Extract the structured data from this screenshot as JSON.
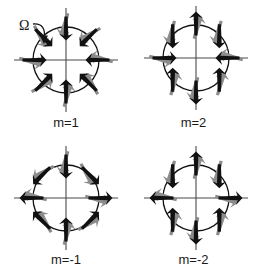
{
  "figure": {
    "background_color": "#ffffff",
    "arrow_dark_color": "#111111",
    "arrow_gray_color": "#8c8c8c",
    "axis_color": "#4a4a4a",
    "ring_color": "#111111",
    "label_color": "#1a1a1a"
  },
  "annotation": {
    "omega_symbol": "Ω",
    "omega_name": "omega-rotation-symbol",
    "arc_direction": "counterclockwise",
    "arc_icon": "curved-arrow-icon"
  },
  "chart_data": {
    "type": "diagram",
    "xlabel": "",
    "ylabel": "",
    "grid": false,
    "legend": "none",
    "n_arrows_per_panel": 8,
    "arrow_positions_deg": [
      90,
      45,
      0,
      315,
      270,
      225,
      180,
      135
    ],
    "panels": [
      {
        "id": "m1",
        "label": "m=1",
        "m": 1,
        "row": 0,
        "col": 0,
        "center": [
          66,
          60
        ],
        "radius": 33,
        "axis_half_length": 52,
        "has_omega": true,
        "arrows": [
          {
            "pos_deg": 90,
            "dir_deg": 270
          },
          {
            "pos_deg": 45,
            "dir_deg": 225
          },
          {
            "pos_deg": 0,
            "dir_deg": 180
          },
          {
            "pos_deg": 315,
            "dir_deg": 135
          },
          {
            "pos_deg": 270,
            "dir_deg": 90
          },
          {
            "pos_deg": 225,
            "dir_deg": 45
          },
          {
            "pos_deg": 180,
            "dir_deg": 0
          },
          {
            "pos_deg": 135,
            "dir_deg": 315
          }
        ]
      },
      {
        "id": "m2",
        "label": "m=2",
        "m": 2,
        "row": 0,
        "col": 1,
        "center": [
          196,
          58
        ],
        "radius": 33,
        "axis_half_length": 52,
        "has_omega": false,
        "arrows": [
          {
            "pos_deg": 90,
            "dir_deg": 90
          },
          {
            "pos_deg": 45,
            "dir_deg": 270
          },
          {
            "pos_deg": 0,
            "dir_deg": 180
          },
          {
            "pos_deg": 315,
            "dir_deg": 90
          },
          {
            "pos_deg": 270,
            "dir_deg": 270
          },
          {
            "pos_deg": 225,
            "dir_deg": 90
          },
          {
            "pos_deg": 180,
            "dir_deg": 0
          },
          {
            "pos_deg": 135,
            "dir_deg": 270
          }
        ]
      },
      {
        "id": "mm1",
        "label": "m=-1",
        "m": -1,
        "row": 1,
        "col": 0,
        "center": [
          66,
          198
        ],
        "radius": 33,
        "axis_half_length": 52,
        "has_omega": false,
        "arrows": [
          {
            "pos_deg": 90,
            "dir_deg": 270
          },
          {
            "pos_deg": 45,
            "dir_deg": 315
          },
          {
            "pos_deg": 0,
            "dir_deg": 0
          },
          {
            "pos_deg": 315,
            "dir_deg": 45
          },
          {
            "pos_deg": 270,
            "dir_deg": 90
          },
          {
            "pos_deg": 225,
            "dir_deg": 135
          },
          {
            "pos_deg": 180,
            "dir_deg": 180
          },
          {
            "pos_deg": 135,
            "dir_deg": 225
          }
        ]
      },
      {
        "id": "mm2",
        "label": "m=-2",
        "m": -2,
        "row": 1,
        "col": 1,
        "center": [
          196,
          198
        ],
        "radius": 33,
        "axis_half_length": 52,
        "has_omega": false,
        "arrows": [
          {
            "pos_deg": 90,
            "dir_deg": 90
          },
          {
            "pos_deg": 45,
            "dir_deg": 270
          },
          {
            "pos_deg": 0,
            "dir_deg": 0
          },
          {
            "pos_deg": 315,
            "dir_deg": 90
          },
          {
            "pos_deg": 270,
            "dir_deg": 270
          },
          {
            "pos_deg": 225,
            "dir_deg": 90
          },
          {
            "pos_deg": 180,
            "dir_deg": 180
          },
          {
            "pos_deg": 135,
            "dir_deg": 270
          }
        ]
      }
    ]
  }
}
